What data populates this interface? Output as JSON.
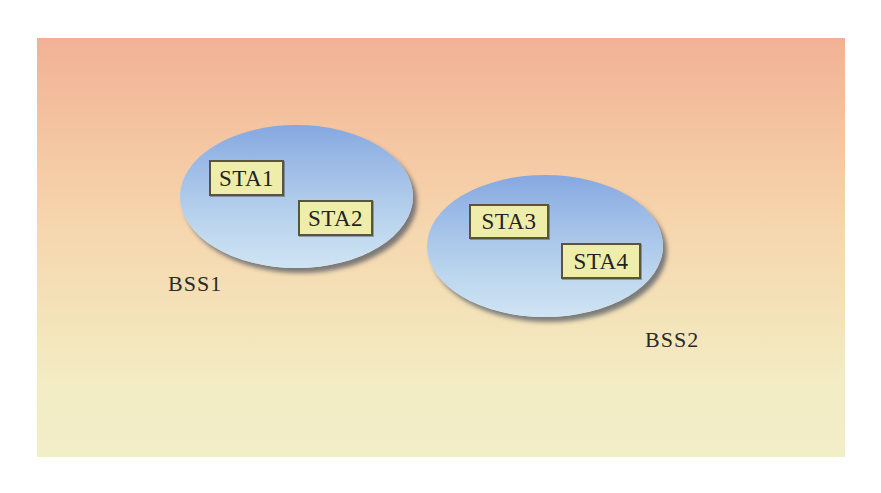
{
  "diagram": {
    "background_gradient": [
      "#f2b196",
      "#f6d6ae",
      "#f2eec8"
    ],
    "ellipse_color": "#a2c0e8",
    "station_box_color": "#eeeeaa",
    "station_border_color": "#5a5438",
    "bss": [
      {
        "label": "BSS1",
        "stations": [
          "STA1",
          "STA2"
        ]
      },
      {
        "label": "BSS2",
        "stations": [
          "STA3",
          "STA4"
        ]
      }
    ]
  }
}
